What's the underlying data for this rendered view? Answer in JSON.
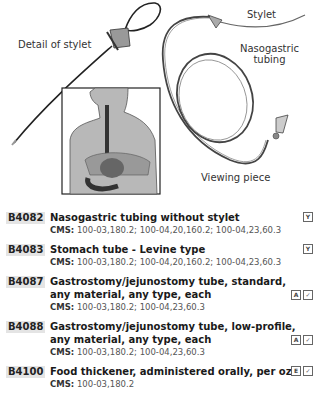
{
  "illustration": {
    "labels": {
      "detail_of_stylet": "Detail of stylet",
      "stylet": "Stylet",
      "nasogastric_line1": "Nasogastric",
      "nasogastric_line2": "tubing",
      "viewing_piece": "Viewing piece"
    }
  },
  "entries": [
    {
      "code": "B4082",
      "description": "Nasogastric tubing without stylet",
      "cms_label": "CMS:",
      "cms": "100-03,180.2; 100-04,20,160.2; 100-04,23,60.3",
      "badges": [
        "Y"
      ]
    },
    {
      "code": "B4083",
      "description": "Stomach tube - Levine type",
      "cms_label": "CMS:",
      "cms": "100-03,180.2; 100-04,20,160.2; 100-04,23,60.3",
      "badges": [
        "Y"
      ]
    },
    {
      "code": "B4087",
      "description": "Gastrostomy/jejunostomy tube, standard, any material, any type, each",
      "cms_label": "CMS:",
      "cms": "100-03,180.2; 100-04,23,60.3",
      "badges": [
        "A",
        "✓"
      ]
    },
    {
      "code": "B4088",
      "description": "Gastrostomy/jejunostomy tube, low-profile, any material, any type, each",
      "cms_label": "CMS:",
      "cms": "100-03,180.2; 100-04,23,60.3",
      "badges": [
        "A",
        "✓"
      ]
    },
    {
      "code": "B4100",
      "description": "Food thickener, administered orally, per oz",
      "cms_label": "CMS:",
      "cms": "100-03,180.2",
      "badges": [
        "E",
        "✓"
      ]
    }
  ]
}
